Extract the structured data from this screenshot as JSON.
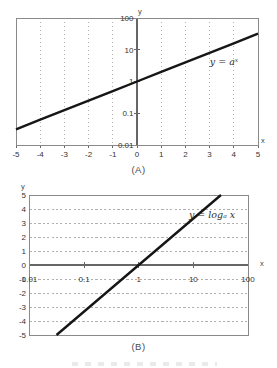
{
  "palette": {
    "line": "#161616",
    "grid": "#b0b0b0",
    "axis": "#666666",
    "border": "#8a8a8a",
    "text": "#333333",
    "background": "#ffffff"
  },
  "chart_data": [
    {
      "id": "A",
      "type": "line",
      "caption": "(A)",
      "annotation": "y = aˣ",
      "x_axis": {
        "label": "x",
        "scale": "linear",
        "min": -5,
        "max": 5,
        "grid": true,
        "tick_labels": [
          "-5",
          "-4",
          "-3",
          "-2",
          "-1",
          "0",
          "1",
          "2",
          "3",
          "4",
          "5"
        ],
        "tick_values": [
          -5,
          -4,
          -3,
          -2,
          -1,
          0,
          1,
          2,
          3,
          4,
          5
        ]
      },
      "y_axis": {
        "label": "y",
        "scale": "log",
        "min": 0.01,
        "max": 100,
        "grid": false,
        "tick_labels": [
          "100",
          "10",
          "1",
          "0.1",
          "0.01"
        ],
        "tick_values": [
          100,
          10,
          1,
          0.1,
          0.01
        ]
      },
      "series": [
        {
          "name": "y = aˣ (a ≈ 2)",
          "points": [
            [
              -5,
              0.03125
            ],
            [
              -4,
              0.0625
            ],
            [
              -3,
              0.125
            ],
            [
              -2,
              0.25
            ],
            [
              -1,
              0.5
            ],
            [
              0,
              1
            ],
            [
              1,
              2
            ],
            [
              2,
              4
            ],
            [
              3,
              8
            ],
            [
              4,
              16
            ],
            [
              5,
              32
            ]
          ]
        }
      ]
    },
    {
      "id": "B",
      "type": "line",
      "caption": "(B)",
      "annotation": "y = logₐ x",
      "x_axis": {
        "label": "x",
        "scale": "log",
        "min": 0.01,
        "max": 100,
        "grid": false,
        "tick_labels": [
          "0.01",
          "0.1",
          "1",
          "10",
          "100"
        ],
        "tick_values": [
          0.01,
          0.1,
          1,
          10,
          100
        ]
      },
      "y_axis": {
        "label": "y",
        "scale": "linear",
        "min": -5,
        "max": 5,
        "grid": true,
        "tick_labels": [
          "5",
          "4",
          "3",
          "2",
          "1",
          "0",
          "-1",
          "-2",
          "-3",
          "-4",
          "-5"
        ],
        "tick_values": [
          5,
          4,
          3,
          2,
          1,
          0,
          -1,
          -2,
          -3,
          -4,
          -5
        ]
      },
      "series": [
        {
          "name": "y = logₐ x (a ≈ 2)",
          "points": [
            [
              0.03125,
              -5
            ],
            [
              0.0625,
              -4
            ],
            [
              0.125,
              -3
            ],
            [
              0.25,
              -2
            ],
            [
              0.5,
              -1
            ],
            [
              1,
              0
            ],
            [
              2,
              1
            ],
            [
              4,
              2
            ],
            [
              8,
              3
            ],
            [
              16,
              4
            ],
            [
              32,
              5
            ]
          ]
        }
      ]
    }
  ]
}
